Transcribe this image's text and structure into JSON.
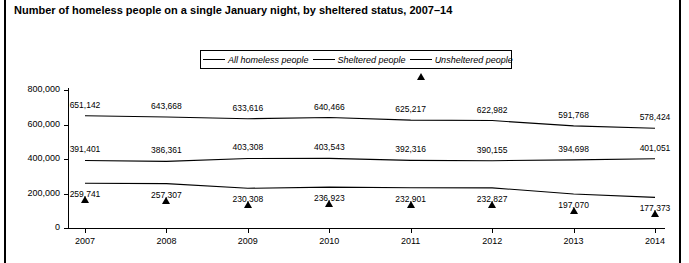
{
  "figure": {
    "title": "Number of homeless people on a single January night, by sheltered status, 2007–14"
  },
  "legend": {
    "items": [
      {
        "label": "All homeless people",
        "marker": "circle-marker-icon"
      },
      {
        "label": "Sheltered people",
        "marker": "square-marker-icon"
      },
      {
        "label": "Unsheltered people",
        "marker": "triangle-marker-icon"
      }
    ]
  },
  "axes": {
    "y_tick_labels": [
      "800,000",
      "600,000",
      "400,000",
      "200,000",
      "0"
    ],
    "x_tick_labels": [
      "2007",
      "2008",
      "2009",
      "2010",
      "2011",
      "2012",
      "2013",
      "2014"
    ]
  },
  "chart_data": {
    "type": "line",
    "title": "Number of homeless people on a single January night, by sheltered status, 2007–14",
    "xlabel": "",
    "ylabel": "",
    "x": [
      2007,
      2008,
      2009,
      2010,
      2011,
      2012,
      2013,
      2014
    ],
    "categories": [
      "2007",
      "2008",
      "2009",
      "2010",
      "2011",
      "2012",
      "2013",
      "2014"
    ],
    "ylim": [
      0,
      800000
    ],
    "ytick_values": [
      0,
      200000,
      400000,
      600000,
      800000
    ],
    "grid": false,
    "legend_position": "top-center",
    "series": [
      {
        "name": "All homeless people",
        "marker": "circle",
        "values": [
          651142,
          643668,
          633616,
          640466,
          625217,
          622982,
          591768,
          578424
        ],
        "labels": [
          "651,142",
          "643,668",
          "633,616",
          "640,466",
          "625,217",
          "622,982",
          "591,768",
          "578,424"
        ],
        "label_position": "above"
      },
      {
        "name": "Sheltered people",
        "marker": "square",
        "values": [
          391401,
          386361,
          403308,
          403543,
          392316,
          390155,
          394698,
          401051
        ],
        "labels": [
          "391,401",
          "386,361",
          "403,308",
          "403,543",
          "392,316",
          "390,155",
          "394,698",
          "401,051"
        ],
        "label_position": "above"
      },
      {
        "name": "Unsheltered people",
        "marker": "triangle",
        "values": [
          259741,
          257307,
          230308,
          236923,
          232901,
          232827,
          197070,
          177373
        ],
        "labels": [
          "259,741",
          "257,307",
          "230,308",
          "236,923",
          "232,901",
          "232,827",
          "197,070",
          "177,373"
        ],
        "label_position": "below"
      }
    ]
  },
  "footnote": {
    "text": ""
  }
}
